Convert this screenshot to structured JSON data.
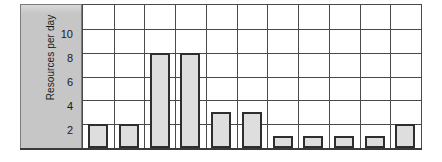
{
  "chart_data": {
    "type": "bar",
    "title": "",
    "subtitle": "",
    "xlabel": "",
    "ylabel": "Resources per day",
    "categories": [
      "1",
      "2",
      "3",
      "4",
      "5",
      "6",
      "7",
      "8",
      "9",
      "10",
      "11"
    ],
    "values": [
      2,
      2,
      8,
      8,
      3,
      3,
      1,
      1,
      1,
      1,
      2
    ],
    "series": [
      {
        "name": "Resources per day",
        "values": [
          2,
          2,
          8,
          8,
          3,
          3,
          1,
          1,
          1,
          1,
          2
        ]
      }
    ],
    "ylim": [
      0,
      12
    ],
    "xlim": [
      0,
      11
    ],
    "ytick_values": [
      2,
      4,
      6,
      8,
      10
    ],
    "ytick_labels": [
      "2",
      "4",
      "6",
      "8",
      "10"
    ],
    "xtick_labels": [],
    "grid": true,
    "grid_axis": "both",
    "legend": false,
    "legend_position": "none",
    "annotations": [],
    "colors": {
      "bar_fill": "#dedede",
      "bar_edge": "#2e2e2e",
      "grid_line": "#4a4a4a",
      "axis_panel": "#c6c6c6",
      "axis_panel_border": "#7d7d7d",
      "text": "#1a1a1a",
      "background": "#ffffff"
    }
  },
  "axis": {
    "y_title": "Resources per day",
    "ticks": [
      {
        "label": "10",
        "value": 10
      },
      {
        "label": "8",
        "value": 8
      },
      {
        "label": "6",
        "value": 6
      },
      {
        "label": "4",
        "value": 4
      },
      {
        "label": "2",
        "value": 2
      }
    ]
  }
}
